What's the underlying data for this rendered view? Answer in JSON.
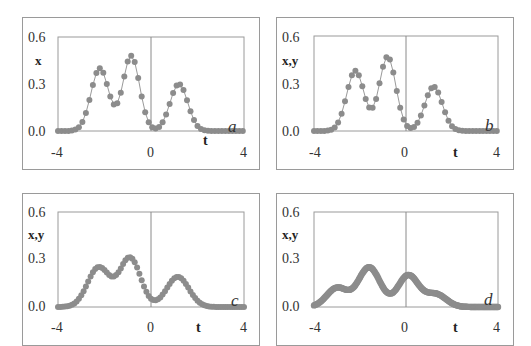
{
  "chart_data": [
    {
      "panel": "a",
      "type": "scatter",
      "title": "",
      "xlabel": "t",
      "ylabel": "x",
      "xlim": [
        -4,
        4
      ],
      "ylim": [
        0,
        0.6
      ],
      "xticks": [
        "-4",
        "0",
        "4"
      ],
      "yticks": [
        "0.0",
        "0.3",
        "0.6"
      ],
      "grid": false,
      "legend": null,
      "style": "markers-with-line",
      "components": [
        {
          "center": -2.2,
          "amp": 0.4,
          "width": 0.38
        },
        {
          "center": -0.85,
          "amp": 0.48,
          "width": 0.36
        },
        {
          "center": 1.2,
          "amp": 0.3,
          "width": 0.38
        }
      ],
      "key_points": {
        "x": [
          -4,
          -3,
          -2.2,
          -1.55,
          -0.85,
          0.3,
          1.2,
          2.2,
          4
        ],
        "y": [
          0.0,
          0.01,
          0.4,
          0.05,
          0.48,
          0.02,
          0.3,
          0.01,
          0.0
        ]
      }
    },
    {
      "panel": "b",
      "type": "scatter",
      "title": "",
      "xlabel": "t",
      "ylabel": "x,y",
      "xlim": [
        -4,
        4
      ],
      "ylim": [
        0,
        0.6
      ],
      "xticks": [
        "-4",
        "0",
        "4"
      ],
      "yticks": [
        "0.0",
        "0.3",
        "0.6"
      ],
      "grid": false,
      "legend": null,
      "style": "markers-with-line",
      "components": [
        {
          "center": -2.2,
          "amp": 0.38,
          "width": 0.38
        },
        {
          "center": -0.8,
          "amp": 0.47,
          "width": 0.36
        },
        {
          "center": 1.2,
          "amp": 0.28,
          "width": 0.38
        }
      ],
      "key_points": {
        "x": [
          -4,
          -3,
          -2.2,
          -1.5,
          -0.8,
          0.3,
          1.2,
          2.2,
          4
        ],
        "y": [
          0.0,
          0.01,
          0.38,
          0.05,
          0.47,
          0.02,
          0.28,
          0.01,
          0.0
        ]
      }
    },
    {
      "panel": "c",
      "type": "scatter",
      "title": "",
      "xlabel": "t",
      "ylabel": "x,y",
      "xlim": [
        -4,
        4
      ],
      "ylim": [
        0,
        0.6
      ],
      "xticks": [
        "-4",
        "0",
        "4"
      ],
      "yticks": [
        "0.0",
        "0.3",
        "0.6"
      ],
      "grid": false,
      "legend": null,
      "style": "markers",
      "components": [
        {
          "center": -2.25,
          "amp": 0.25,
          "width": 0.48
        },
        {
          "center": -0.9,
          "amp": 0.31,
          "width": 0.45
        },
        {
          "center": 1.15,
          "amp": 0.19,
          "width": 0.48
        }
      ],
      "key_points": {
        "x": [
          -4,
          -3,
          -2.2,
          -1.55,
          -0.9,
          0.3,
          1.15,
          2.3,
          4
        ],
        "y": [
          0.0,
          0.05,
          0.26,
          0.14,
          0.34,
          0.08,
          0.19,
          0.0,
          0.0
        ]
      }
    },
    {
      "panel": "d",
      "type": "scatter",
      "title": "",
      "xlabel": "t",
      "ylabel": "x,y",
      "xlim": [
        -4,
        4
      ],
      "ylim": [
        0,
        0.6
      ],
      "xticks": [
        "-4",
        "0",
        "4"
      ],
      "yticks": [
        "0.0",
        "0.3",
        "0.6"
      ],
      "grid": false,
      "legend": null,
      "style": "dense-markers",
      "components": [
        {
          "center": -3.0,
          "amp": 0.12,
          "width": 0.45
        },
        {
          "center": -1.6,
          "amp": 0.25,
          "width": 0.48
        },
        {
          "center": 0.1,
          "amp": 0.2,
          "width": 0.45
        },
        {
          "center": 1.3,
          "amp": 0.08,
          "width": 0.45
        }
      ],
      "key_points": {
        "x": [
          -4,
          -3,
          -2.3,
          -1.55,
          -0.4,
          0.1,
          1.2,
          2.2,
          4
        ],
        "y": [
          0.01,
          0.13,
          0.15,
          0.28,
          0.18,
          0.22,
          0.08,
          0.0,
          0.0
        ]
      }
    }
  ],
  "panels": [
    {
      "id": "a",
      "letter": "a",
      "ylabel": "x",
      "xlabel": "t",
      "yticks": [
        "0.6",
        "0.3",
        "0.0"
      ],
      "xticks": [
        "-4",
        "0",
        "4"
      ]
    },
    {
      "id": "b",
      "letter": "b",
      "ylabel": "x,y",
      "xlabel": "t",
      "yticks": [
        "0.6",
        "0.3",
        "0.0"
      ],
      "xticks": [
        "-4",
        "0",
        "4"
      ]
    },
    {
      "id": "c",
      "letter": "c",
      "ylabel": "x,y",
      "xlabel": "t",
      "yticks": [
        "0.6",
        "0.3",
        "0.0"
      ],
      "xticks": [
        "-4",
        "0",
        "4"
      ]
    },
    {
      "id": "d",
      "letter": "d",
      "ylabel": "x,y",
      "xlabel": "t",
      "yticks": [
        "0.6",
        "0.3",
        "0.0"
      ],
      "xticks": [
        "-4",
        "0",
        "4"
      ]
    }
  ],
  "colors": {
    "marker": "#8c8c8c",
    "line": "#9a9a9a",
    "frame": "#9a9a9a",
    "zero_line": "#8a8a8a"
  }
}
